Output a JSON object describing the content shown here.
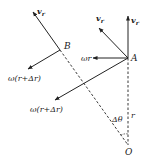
{
  "diagram": {
    "colors": {
      "stroke": "#222222",
      "background": "#ffffff"
    },
    "points": {
      "O": {
        "label": "O",
        "x": 128,
        "y": 145
      },
      "A": {
        "label": "A",
        "x": 128,
        "y": 58
      },
      "B": {
        "label": "B",
        "x": 60,
        "y": 50
      }
    },
    "labels": {
      "vr_B": {
        "main": "v",
        "sub": "r"
      },
      "vr_A_up": {
        "main": "v",
        "sub": "r"
      },
      "vr_A_diag": {
        "main": "v",
        "sub": "r"
      },
      "omega_r": "ωr",
      "omega_r_dr_A": "ω(r+Δr)",
      "omega_r_dr_B": "ω(r+Δr)",
      "delta_theta": "Δθ",
      "r": "r"
    }
  }
}
